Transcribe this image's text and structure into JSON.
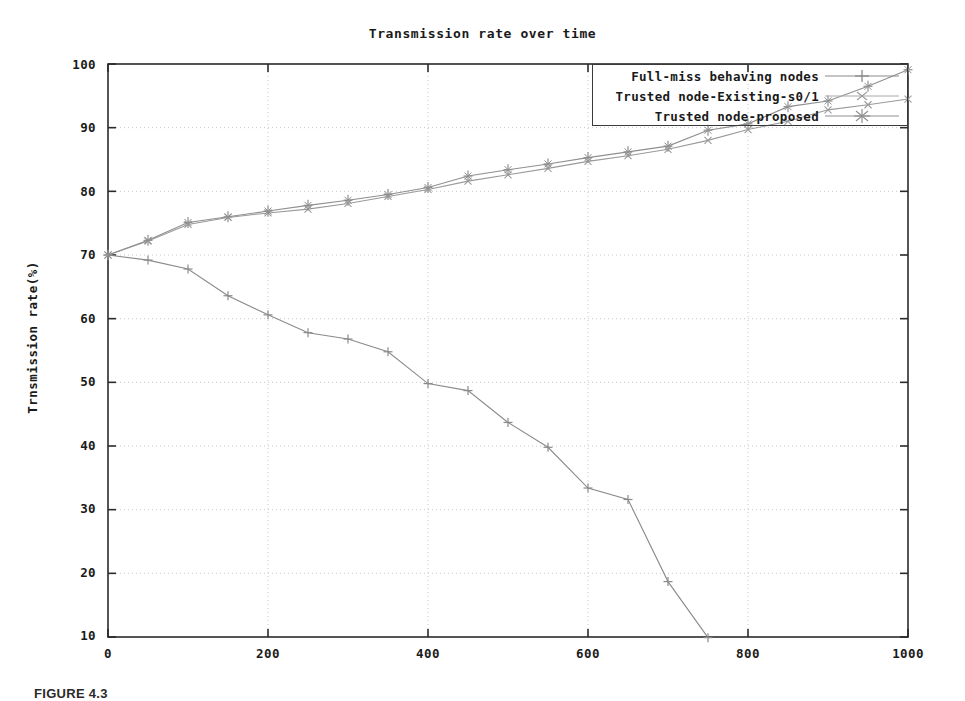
{
  "chart_data": {
    "type": "line",
    "title": "Transmission rate over time",
    "xlabel": "",
    "ylabel": "Trnsmission rate(%)",
    "xlim": [
      0,
      1000
    ],
    "ylim": [
      10,
      100
    ],
    "xticks": [
      0,
      200,
      400,
      600,
      800,
      1000
    ],
    "yticks": [
      10,
      20,
      30,
      40,
      50,
      60,
      70,
      80,
      90,
      100
    ],
    "grid": true,
    "legend_position": "top-right",
    "series": [
      {
        "name": "Full-miss behaving nodes",
        "marker": "plus",
        "color": "#8a8a8a",
        "x": [
          0,
          50,
          100,
          150,
          200,
          250,
          300,
          350,
          400,
          450,
          500,
          550,
          600,
          650,
          700,
          750
        ],
        "values": [
          70.0,
          69.2,
          67.8,
          63.6,
          60.6,
          57.8,
          56.8,
          54.8,
          49.8,
          48.7,
          43.7,
          39.8,
          33.4,
          31.6,
          18.7,
          9.9
        ]
      },
      {
        "name": "Trusted node-Existing-s0/1",
        "marker": "x",
        "color": "#9a9a9a",
        "x": [
          0,
          50,
          100,
          150,
          200,
          250,
          300,
          350,
          400,
          450,
          500,
          550,
          600,
          650,
          700,
          750,
          800,
          850,
          900,
          950,
          1000
        ],
        "values": [
          70.0,
          72.2,
          74.8,
          75.9,
          76.6,
          77.2,
          78.1,
          79.2,
          80.3,
          81.6,
          82.6,
          83.6,
          84.7,
          85.6,
          86.6,
          88.0,
          89.7,
          91.0,
          92.8,
          93.6,
          94.5
        ]
      },
      {
        "name": "Trusted node-proposed",
        "marker": "star",
        "color": "#8f8f8f",
        "x": [
          0,
          50,
          100,
          150,
          200,
          250,
          300,
          350,
          400,
          450,
          500,
          550,
          600,
          650,
          700,
          750,
          800,
          850,
          900,
          950,
          1000
        ],
        "values": [
          70.0,
          72.3,
          75.1,
          76.0,
          76.9,
          77.8,
          78.6,
          79.5,
          80.6,
          82.4,
          83.4,
          84.3,
          85.3,
          86.2,
          87.1,
          89.6,
          90.6,
          93.3,
          94.2,
          96.5,
          99.1
        ]
      }
    ]
  },
  "axis": {
    "yticklabels": [
      "100",
      "90",
      "80",
      "70",
      "60",
      "50",
      "40",
      "30",
      "20",
      "10"
    ],
    "xticklabels": [
      "0",
      "200",
      "400",
      "600",
      "800",
      "1000"
    ]
  },
  "legend": {
    "entries": [
      {
        "label": "Full-miss behaving nodes"
      },
      {
        "label": "Trusted node-Existing-s0/1"
      },
      {
        "label": "Trusted node-proposed"
      }
    ]
  },
  "caption": {
    "text": "FIGURE 4.3"
  },
  "colors": {
    "axis": "#2b2b2b",
    "grid": "#c8c8c8",
    "text": "#1a1a1a",
    "series1": "#8a8a8a",
    "series2": "#9a9a9a",
    "series3": "#8f8f8f"
  }
}
